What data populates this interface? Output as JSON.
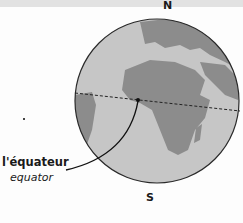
{
  "labels": {
    "north": "N",
    "south": "S",
    "equator_fr": "l'équateur",
    "equator_en": "equator"
  },
  "colors": {
    "ocean": "#c9c9c9",
    "land": "#8a8a8a",
    "outline": "#2a2a2a",
    "equator_line": "#222222"
  }
}
